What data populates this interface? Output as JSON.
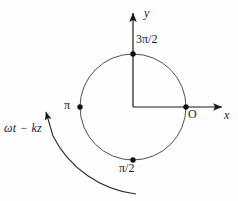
{
  "figure": {
    "background_color": "#fefefe",
    "stroke_color": "#1a1a1a"
  },
  "axes": {
    "y_label": "y",
    "x_label": "x",
    "origin_label": "O"
  },
  "circle": {
    "center_x": 133,
    "center_y": 107,
    "radius": 53
  },
  "markers": [
    {
      "name": "top",
      "label": "3π/2",
      "angle_deg": 90,
      "x": 133,
      "y": 54
    },
    {
      "name": "left",
      "label": "π",
      "angle_deg": 180,
      "x": 80,
      "y": 107
    },
    {
      "name": "bottom",
      "label": "π/2",
      "angle_deg": 270,
      "x": 133,
      "y": 160
    },
    {
      "name": "right",
      "label": "O",
      "angle_deg": 0,
      "x": 186,
      "y": 107
    }
  ],
  "annotations": {
    "phase_label": "ωt − kz"
  }
}
